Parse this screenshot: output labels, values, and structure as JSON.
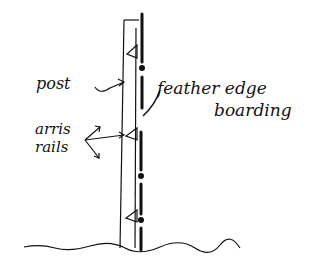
{
  "diagram": {
    "title": "",
    "labels": {
      "post": "post",
      "feather_edge": "feather edge",
      "boarding": "boarding",
      "arris": "arris",
      "rails": "rails"
    },
    "components": [
      "post",
      "feather edge boarding",
      "arris rails (x3)",
      "ground line"
    ],
    "colors": {
      "ink": "#111111",
      "background": "#ffffff"
    }
  }
}
